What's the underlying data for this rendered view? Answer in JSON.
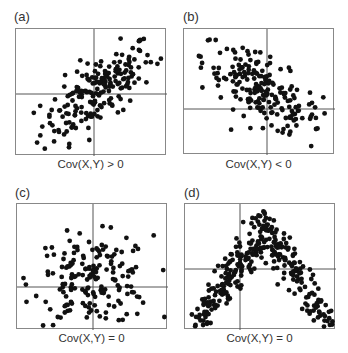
{
  "chart_data": [
    {
      "type": "scatter",
      "panel": "(a)",
      "title": "(a)",
      "caption": "Cov(X,Y) > 0",
      "xlabel": "",
      "ylabel": "",
      "axes": "centered crosshair lines through means; no ticks",
      "grid": false,
      "correlation": "positive",
      "approx_points": 200,
      "trend": "points rise from lower-left to upper-right"
    },
    {
      "type": "scatter",
      "panel": "(b)",
      "title": "(b)",
      "caption": "Cov(X,Y) < 0",
      "xlabel": "",
      "ylabel": "",
      "axes": "centered crosshair lines through means; no ticks",
      "grid": false,
      "correlation": "negative",
      "approx_points": 200,
      "trend": "points fall from upper-left to lower-right"
    },
    {
      "type": "scatter",
      "panel": "(c)",
      "title": "(c)",
      "caption": "Cov(X,Y) = 0",
      "xlabel": "",
      "ylabel": "",
      "axes": "centered crosshair lines through means; no ticks",
      "grid": false,
      "correlation": "none",
      "approx_points": 180,
      "trend": "round, uncorrelated cloud centered at crosshair"
    },
    {
      "type": "scatter",
      "panel": "(d)",
      "title": "(d)",
      "caption": "Cov(X,Y) = 0",
      "xlabel": "",
      "ylabel": "",
      "axes": "centered crosshair lines through means; no ticks",
      "grid": false,
      "correlation": "zero covariance but dependent",
      "approx_points": 320,
      "trend": "inverted-V: left cluster rises, right cluster falls"
    }
  ],
  "panels": [
    {
      "label": "(a)",
      "caption": "Cov(X,Y) > 0"
    },
    {
      "label": "(b)",
      "caption": "Cov(X,Y) < 0"
    },
    {
      "label": "(c)",
      "caption": "Cov(X,Y) = 0"
    },
    {
      "label": "(d)",
      "caption": "Cov(X,Y) = 0"
    }
  ],
  "colors": {
    "dot": "#111111",
    "axis": "#555555",
    "frame": "#888888"
  }
}
